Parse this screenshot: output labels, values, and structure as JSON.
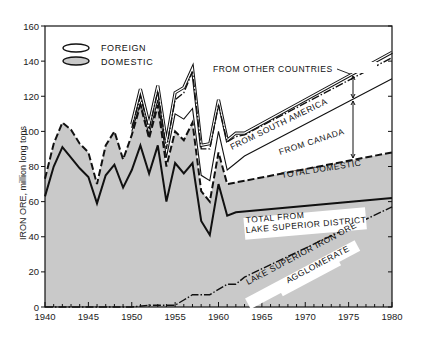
{
  "chart_data": {
    "type": "area",
    "title": "",
    "xlabel": "",
    "ylabel": "IRON ORE, million long tons",
    "xlim": [
      1940,
      1980
    ],
    "ylim": [
      0,
      160
    ],
    "x_ticks": [
      1940,
      1945,
      1950,
      1955,
      1960,
      1965,
      1970,
      1975,
      1980
    ],
    "y_ticks": [
      0,
      20,
      40,
      60,
      80,
      100,
      120,
      140,
      160
    ],
    "grid": false,
    "legend": {
      "position": "upper-left",
      "entries": [
        {
          "label": "FOREIGN",
          "fill": "#ffffff"
        },
        {
          "label": "DOMESTIC",
          "fill": "#c9c9c9"
        }
      ]
    },
    "series": [
      {
        "name": "Total (incl. from other countries)",
        "style": "double-line",
        "x": [
          1950,
          1951,
          1952,
          1953,
          1954,
          1955,
          1956,
          1957,
          1958,
          1959,
          1960,
          1961,
          1962,
          1963,
          1980
        ],
        "values": [
          104,
          124,
          104,
          126,
          94,
          122,
          125,
          136,
          92,
          93,
          118,
          95,
          99,
          99,
          145
        ]
      },
      {
        "name": "From South America (cumulative)",
        "style": "dash-dot",
        "x": [
          1950,
          1951,
          1952,
          1953,
          1954,
          1955,
          1956,
          1957,
          1958,
          1959,
          1960,
          1961,
          1962,
          1963,
          1980
        ],
        "values": [
          102,
          120,
          101,
          123,
          90,
          118,
          122,
          134,
          90,
          90,
          115,
          94,
          97,
          98,
          142
        ]
      },
      {
        "name": "From Canada (cumulative)",
        "style": "thin-solid",
        "x": [
          1950,
          1951,
          1952,
          1953,
          1954,
          1955,
          1956,
          1957,
          1958,
          1959,
          1960,
          1961,
          1962,
          1963,
          1980
        ],
        "values": [
          100,
          116,
          98,
          118,
          85,
          110,
          107,
          113,
          75,
          72,
          100,
          78,
          82,
          86,
          130
        ]
      },
      {
        "name": "Total Domestic",
        "style": "dashed",
        "x": [
          1940,
          1941,
          1942,
          1943,
          1944,
          1945,
          1946,
          1947,
          1948,
          1949,
          1950,
          1951,
          1952,
          1953,
          1954,
          1955,
          1956,
          1957,
          1958,
          1959,
          1960,
          1961,
          1980
        ],
        "values": [
          73,
          93,
          105,
          101,
          93,
          88,
          70,
          92,
          100,
          84,
          98,
          115,
          96,
          115,
          80,
          100,
          95,
          105,
          66,
          60,
          88,
          70,
          88
        ]
      },
      {
        "name": "Total from Lake Superior District",
        "style": "solid",
        "x": [
          1940,
          1941,
          1942,
          1943,
          1944,
          1945,
          1946,
          1947,
          1948,
          1949,
          1950,
          1951,
          1952,
          1953,
          1954,
          1955,
          1956,
          1957,
          1958,
          1959,
          1960,
          1961,
          1962,
          1980
        ],
        "values": [
          63,
          80,
          91,
          85,
          79,
          74,
          59,
          75,
          81,
          68,
          78,
          92,
          76,
          92,
          60,
          82,
          76,
          82,
          49,
          41,
          70,
          52,
          54,
          62
        ]
      },
      {
        "name": "Lake Superior Iron Ore Agglomerate",
        "style": "dash-dot",
        "x": [
          1940,
          1950,
          1952,
          1954,
          1955,
          1956,
          1957,
          1958,
          1959,
          1960,
          1961,
          1962,
          1963,
          1980
        ],
        "values": [
          0,
          0,
          1,
          1,
          1,
          4,
          7,
          7,
          7,
          10,
          13,
          13,
          17,
          57
        ]
      }
    ],
    "annotations": [
      "FROM OTHER COUNTRIES",
      "FROM SOUTH AMERICA",
      "FROM CANADA",
      "TOTAL DOMESTIC",
      "TOTAL FROM LAKE SUPERIOR DISTRICT",
      "LAKE SUPERIOR IRON ORE AGGLOMERATE"
    ]
  },
  "labels": {
    "ylabel": "IRON ORE, million long tons",
    "legend_foreign": "FOREIGN",
    "legend_domestic": "DOMESTIC",
    "from_other": "FROM OTHER COUNTRIES",
    "from_sa": "FROM SOUTH AMERICA",
    "from_canada": "FROM CANADA",
    "total_domestic": "TOTAL DOMESTIC",
    "lake_sup_1": "TOTAL FROM",
    "lake_sup_2": "LAKE SUPERIOR DISTRICT",
    "agglom_1": "LAKE SUPERIOR IRON ORE",
    "agglom_2": "AGGLOMERATE"
  }
}
